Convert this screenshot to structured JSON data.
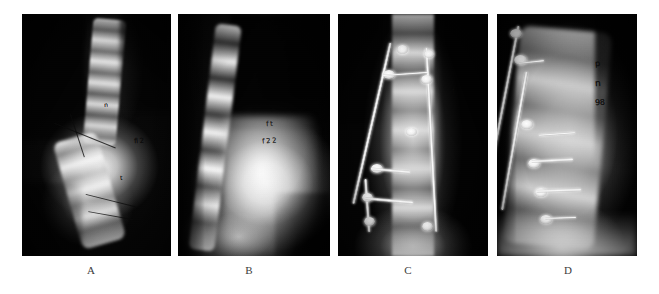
{
  "figure": {
    "kind": "radiograph-panel-figure",
    "panel_count": 4,
    "background_color": "#ffffff",
    "caption_color": "#3c3c3c"
  },
  "panels": [
    {
      "id": "panel-a",
      "caption": "A",
      "modality": "x-ray",
      "view": "anteroposterior",
      "stage": "preoperative",
      "has_instrumentation": false,
      "annotations": [
        {
          "text": "n",
          "kind": "handwritten-marking"
        },
        {
          "text": "ff",
          "kind": "handwritten-marking"
        },
        {
          "text": "fl 2",
          "kind": "handwritten-marking"
        },
        {
          "text": "t",
          "kind": "handwritten-marking"
        }
      ],
      "frame": {
        "x": 22,
        "y": 14,
        "w": 149,
        "h": 242
      },
      "caption_x": 91
    },
    {
      "id": "panel-b",
      "caption": "B",
      "modality": "x-ray",
      "view": "lateral",
      "stage": "preoperative",
      "has_instrumentation": false,
      "annotations": [
        {
          "text": "f t",
          "kind": "handwritten-marking"
        },
        {
          "text": "f 2 2",
          "kind": "handwritten-marking"
        }
      ],
      "frame": {
        "x": 178,
        "y": 14,
        "w": 152,
        "h": 242
      },
      "caption_x": 249
    },
    {
      "id": "panel-c",
      "caption": "C",
      "modality": "x-ray",
      "view": "anteroposterior",
      "stage": "postoperative",
      "has_instrumentation": true,
      "annotations": [
        {
          "text": "f",
          "kind": "handwritten-marking"
        },
        {
          "text": "t",
          "kind": "handwritten-marking"
        }
      ],
      "frame": {
        "x": 338,
        "y": 14,
        "w": 150,
        "h": 242
      },
      "caption_x": 408
    },
    {
      "id": "panel-d",
      "caption": "D",
      "modality": "x-ray",
      "view": "lateral",
      "stage": "postoperative",
      "has_instrumentation": true,
      "annotations": [
        {
          "text": "p",
          "kind": "handwritten-marking"
        },
        {
          "text": "n",
          "kind": "handwritten-marking"
        },
        {
          "text": "98",
          "kind": "handwritten-marking"
        }
      ],
      "frame": {
        "x": 497,
        "y": 14,
        "w": 140,
        "h": 242
      },
      "caption_x": 568
    }
  ],
  "captions": {
    "a": "A",
    "b": "B",
    "c": "C",
    "d": "D",
    "y": 264
  }
}
